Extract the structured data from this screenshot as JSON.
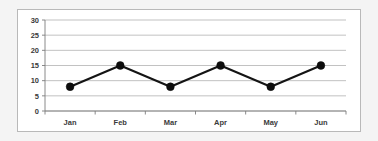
{
  "chart_data": {
    "type": "line",
    "title": "",
    "xlabel": "",
    "ylabel": "",
    "categories": [
      "Jan",
      "Feb",
      "Mar",
      "Apr",
      "May",
      "Jun"
    ],
    "values": [
      8,
      15,
      8,
      15,
      8,
      15
    ],
    "series": [
      {
        "name": "series-1",
        "values": [
          8,
          15,
          8,
          15,
          8,
          15
        ]
      }
    ],
    "ylim": [
      0,
      30
    ],
    "yticks": [
      0,
      5,
      10,
      15,
      20,
      25,
      30
    ],
    "ytick_labels": [
      "0",
      "5",
      "10",
      "15",
      "20",
      "25",
      "30"
    ],
    "grid": true,
    "legend": false,
    "marker": "filled-circle",
    "line_color": "#141414",
    "marker_color": "#0d0d0d",
    "grid_color": "#a8a8a8",
    "plot_background": "#ffffff",
    "page_background": "#f4f4f4",
    "border_color": "#b9b9b9"
  }
}
